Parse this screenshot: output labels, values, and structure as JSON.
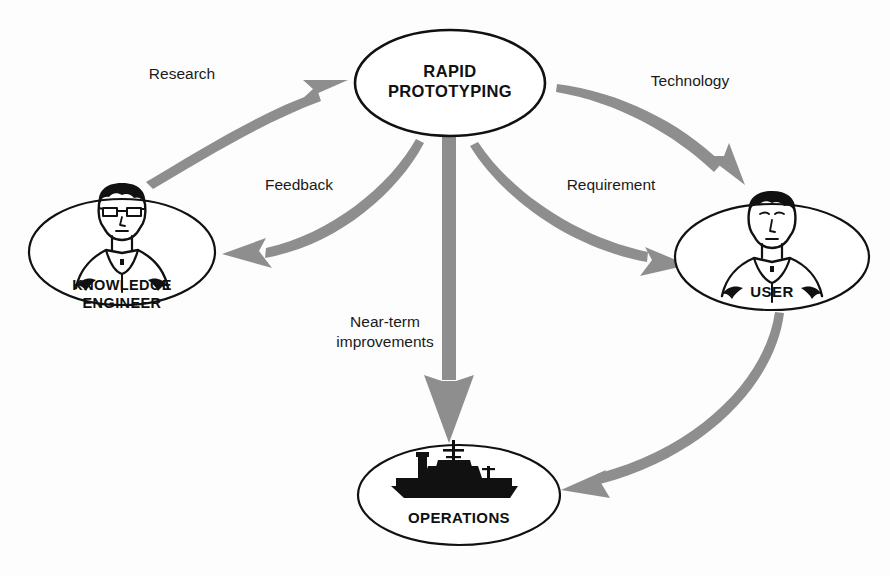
{
  "diagram": {
    "background_color": "#fdfdfd",
    "ink_color": "#111111",
    "arrow_color": "#8e8e8e",
    "nodes": [
      {
        "id": "rapid-prototyping",
        "label_line1": "RAPID",
        "label_line2": "PROTOTYPING",
        "icon": "none",
        "cx": 450,
        "cy": 83,
        "rx": 95,
        "ry": 53
      },
      {
        "id": "knowledge-engineer",
        "label_line1": "KNOWLEDGE",
        "label_line2": "ENGINEER",
        "icon": "person-with-glasses-icon",
        "cx": 122,
        "cy": 252,
        "rx": 93,
        "ry": 53
      },
      {
        "id": "user",
        "label_line1": "USER",
        "label_line2": "",
        "icon": "person-icon",
        "cx": 772,
        "cy": 257,
        "rx": 97,
        "ry": 53
      },
      {
        "id": "operations",
        "label_line1": "OPERATIONS",
        "label_line2": "",
        "icon": "naval-ship-icon",
        "cx": 459,
        "cy": 495,
        "rx": 101,
        "ry": 50
      }
    ],
    "edges": [
      {
        "id": "research",
        "label": "Research",
        "label_x": 182,
        "label_y": 79,
        "from": "knowledge-engineer",
        "to": "rapid-prototyping",
        "style": "curved-tapered"
      },
      {
        "id": "technology",
        "label": "Technology",
        "label_x": 690,
        "label_y": 86,
        "from": "rapid-prototyping",
        "to": "user",
        "style": "curved-tapered"
      },
      {
        "id": "feedback",
        "label": "Feedback",
        "label_x": 299,
        "label_y": 190,
        "from": "rapid-prototyping",
        "to": "knowledge-engineer",
        "style": "curved-tapered"
      },
      {
        "id": "requirement",
        "label": "Requirement",
        "label_x": 611,
        "label_y": 190,
        "from": "rapid-prototyping",
        "to": "user",
        "style": "curved-tapered"
      },
      {
        "id": "near-term-improvements",
        "label_line1": "Near-term",
        "label_line2": "improvements",
        "label_x": 385,
        "label_y": 327,
        "from": "rapid-prototyping",
        "to": "operations",
        "style": "straight-thick"
      },
      {
        "id": "user-to-operations",
        "label": "",
        "from": "user",
        "to": "operations",
        "style": "curved-tapered"
      }
    ]
  }
}
